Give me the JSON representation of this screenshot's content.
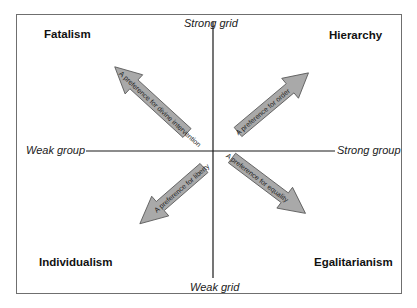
{
  "diagram": {
    "type": "grid-group quadrant diagram",
    "axes": {
      "top": "Strong grid",
      "bottom": "Weak grid",
      "left": "Weak group",
      "right": "Strong group"
    },
    "quadrants": {
      "top_left": {
        "label": "Fatalism",
        "arrow_text": "A preference for divine intervention"
      },
      "top_right": {
        "label": "Hierarchy",
        "arrow_text": "A preference for order"
      },
      "bottom_left": {
        "label": "Individualism",
        "arrow_text": "A preference for liberty"
      },
      "bottom_right": {
        "label": "Egalitarianism",
        "arrow_text": "A preference for equality"
      }
    },
    "colors": {
      "arrow_fill": "#a9a9a9",
      "arrow_stroke": "#555555",
      "axis": "#1a1a1a",
      "frame": "#6f6f6f"
    }
  }
}
